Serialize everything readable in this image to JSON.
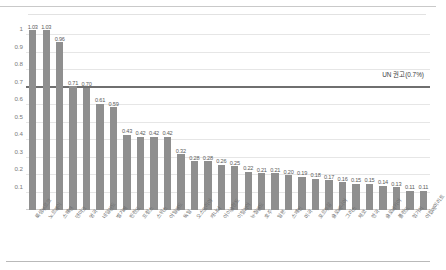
{
  "chart_data": {
    "type": "bar",
    "title": "",
    "subtitle": "",
    "xlabel": "",
    "ylabel": "",
    "ylim": [
      0,
      1.1
    ],
    "yticks": [
      "0.1",
      "0.2",
      "0.3",
      "0.4",
      "0.5",
      "0.6",
      "0.7",
      "0.8",
      "0.9",
      "1"
    ],
    "ytick_values": [
      0.1,
      0.2,
      0.3,
      0.4,
      0.5,
      0.6,
      0.7,
      0.8,
      0.9,
      1.0
    ],
    "grid": true,
    "legend": "none",
    "reference_line": {
      "label": "UN 권고(0.7%)",
      "value": 0.7,
      "color": "#6f6f6f"
    },
    "bar_color": "#8f8f8f",
    "categories": [
      "룩셈부르크",
      "노르웨이",
      "스웨덴",
      "덴마크",
      "영국",
      "네덜란드",
      "벨기에",
      "핀란드",
      "프랑스",
      "스위스",
      "아일랜드",
      "독일",
      "오스트리아",
      "캐나다",
      "아이슬란드",
      "이탈리아",
      "뉴질랜드",
      "호주",
      "일본",
      "스페인",
      "미국",
      "포르투갈",
      "슬로베니아",
      "그리스",
      "체코",
      "한국",
      "슬로바키아",
      "폴란드",
      "헝가리",
      "아랍에미리트"
    ],
    "values": [
      1.03,
      1.03,
      0.96,
      0.71,
      0.7,
      0.61,
      0.59,
      0.43,
      0.42,
      0.42,
      0.42,
      0.32,
      0.28,
      0.28,
      0.26,
      0.25,
      0.22,
      0.21,
      0.21,
      0.2,
      0.19,
      0.18,
      0.17,
      0.16,
      0.15,
      0.15,
      0.14,
      0.13,
      0.11,
      0.11
    ],
    "data_labels": [
      "1.03",
      "1.03",
      "0.96",
      "0.71",
      "0.70",
      "0.61",
      "0.59",
      "0.43",
      "0.42",
      "0.42",
      "0.42",
      "0.32",
      "0.28",
      "0.28",
      "0.26",
      "0.25",
      "0.22",
      "0.21",
      "0.21",
      "0.20",
      "0.19",
      "0.18",
      "0.17",
      "0.16",
      "0.15",
      "0.15",
      "0.14",
      "0.13",
      "0.11",
      "0.11"
    ]
  }
}
